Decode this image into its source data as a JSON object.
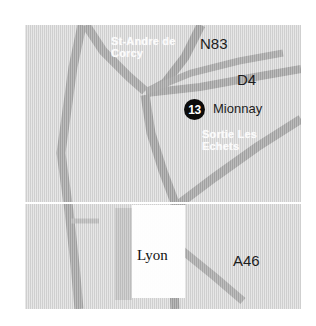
{
  "map": {
    "title": "Road map near Lyon",
    "background_color": "#d9d9d9",
    "road_color": "#9a9a9a",
    "urban_color": "#fdfdfd",
    "divider_color": "#ffffff",
    "labels": {
      "st_andre": "St-Andre de\nCorcy",
      "n83": "N83",
      "d4": "D4",
      "mionnay": "Mionnay",
      "sortie": "Sortie Les\nEchets",
      "lyon": "Lyon",
      "a46": "A46"
    },
    "exit_badge": {
      "number": "13",
      "color": "#0c0c0c",
      "text_color": "#ffffff"
    }
  }
}
